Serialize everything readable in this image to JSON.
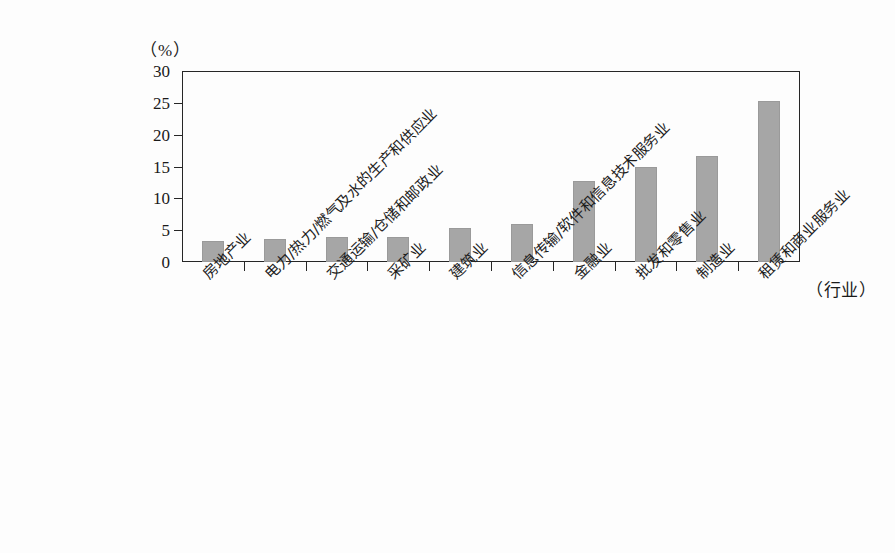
{
  "chart_data": {
    "type": "bar",
    "title": "",
    "xlabel": "（行业）",
    "ylabel": "（%）",
    "ylim": [
      0,
      30
    ],
    "yticks": [
      0,
      5,
      10,
      15,
      20,
      25,
      30
    ],
    "grid": false,
    "legend": "none",
    "bar_color": "#a6a6a6",
    "axis_color": "#262626",
    "categories": [
      "房地产业",
      "电力/热力/燃气及水的生产和供应业",
      "交通运输/仓储和邮政业",
      "采矿业",
      "建筑业",
      "信息传输/软件和信息技术服务业",
      "金融业",
      "批发和零售业",
      "制造业",
      "租赁和商业服务业"
    ],
    "values": [
      3.3,
      3.6,
      3.9,
      4.0,
      5.3,
      6.0,
      12.7,
      14.9,
      16.7,
      25.3
    ]
  }
}
